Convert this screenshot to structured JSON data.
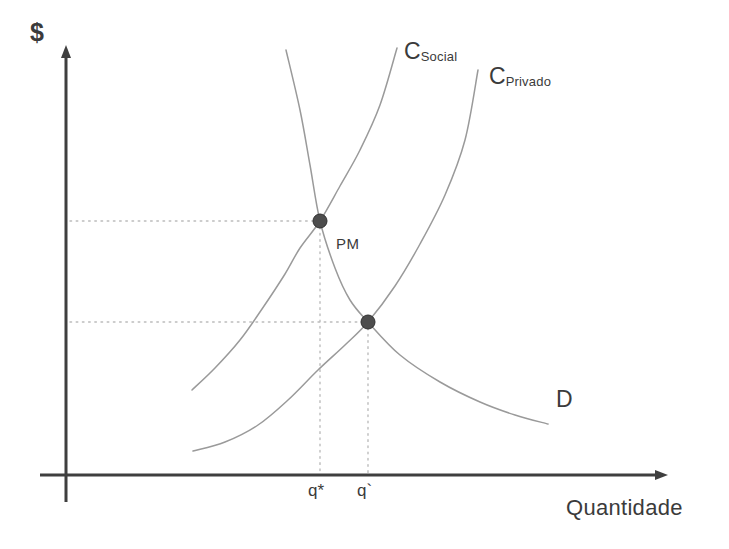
{
  "figure": {
    "background_color": "#ffffff",
    "axes": {
      "y_label": "$",
      "x_label": "Quantidade",
      "axis_color": "#3f3f3f",
      "y_axis_x": 66,
      "x_axis_y": 475,
      "y_axis_top": 45,
      "y_axis_bottom": 502,
      "x_axis_left": 40,
      "x_axis_right": 668
    },
    "curves": [
      {
        "name": "C_Social",
        "label_main": "C",
        "label_sub": "Social",
        "color": "#9a9a9a",
        "label_x": 404,
        "label_y": 40
      },
      {
        "name": "C_Privado",
        "label_main": "C",
        "label_sub": "Privado",
        "color": "#9a9a9a",
        "label_x": 489,
        "label_y": 65
      },
      {
        "name": "Demanda",
        "label_main": "D",
        "label_sub": "",
        "color": "#9a9a9a",
        "label_x": 556,
        "label_y": 388
      }
    ],
    "points": [
      {
        "name": "PM",
        "label": "PM",
        "x": 320,
        "y": 221,
        "color": "#4d4d4d",
        "radius": 7
      },
      {
        "name": "equilibrio-privado",
        "label": "",
        "x": 368,
        "y": 322,
        "color": "#4d4d4d",
        "radius": 7
      }
    ],
    "x_ticks": [
      {
        "label": "q*",
        "x": 320
      },
      {
        "label": "q`",
        "x": 368
      }
    ],
    "guide_lines": {
      "color": "#b9b9b9",
      "horizontal": [
        {
          "y": 221,
          "from_x": 70,
          "to_x": 320
        },
        {
          "y": 322,
          "from_x": 70,
          "to_x": 368
        }
      ],
      "vertical": [
        {
          "x": 320,
          "from_y": 221,
          "to_y": 475
        },
        {
          "x": 368,
          "from_y": 322,
          "to_y": 475
        }
      ]
    }
  },
  "chart_data": {
    "type": "line",
    "title": "",
    "xlabel": "Quantidade",
    "ylabel": "$",
    "xlim": [
      0,
      100
    ],
    "ylim": [
      0,
      100
    ],
    "grid": false,
    "legend": "inline-labels",
    "annotations": [
      "PM",
      "q*",
      "q`",
      "C",
      "Social",
      "Privado",
      "D"
    ],
    "series": [
      {
        "name": "C_Social",
        "label": "C Social",
        "description": "Curva de custo marginal social, crescente e a esquerda",
        "color": "#9a9a9a",
        "points_px": [
          [
            192,
            390
          ],
          [
            215,
            368
          ],
          [
            240,
            340
          ],
          [
            262,
            309
          ],
          [
            285,
            274
          ],
          [
            300,
            248
          ],
          [
            320,
            221
          ],
          [
            340,
            186
          ],
          [
            360,
            150
          ],
          [
            380,
            105
          ],
          [
            397,
            48
          ]
        ]
      },
      {
        "name": "C_Privado",
        "label": "C Privado",
        "description": "Curva de custo marginal privado, crescente e a direita",
        "color": "#9a9a9a",
        "points_px": [
          [
            193,
            451
          ],
          [
            225,
            442
          ],
          [
            258,
            425
          ],
          [
            288,
            400
          ],
          [
            318,
            370
          ],
          [
            345,
            345
          ],
          [
            368,
            322
          ],
          [
            395,
            286
          ],
          [
            420,
            244
          ],
          [
            445,
            195
          ],
          [
            465,
            140
          ],
          [
            478,
            70
          ]
        ]
      },
      {
        "name": "Demanda",
        "label": "D",
        "description": "Curva de demanda decrescente convexa",
        "color": "#9a9a9a",
        "points_px": [
          [
            286,
            50
          ],
          [
            300,
            110
          ],
          [
            310,
            165
          ],
          [
            320,
            221
          ],
          [
            335,
            268
          ],
          [
            350,
            300
          ],
          [
            368,
            322
          ],
          [
            400,
            355
          ],
          [
            440,
            382
          ],
          [
            480,
            402
          ],
          [
            515,
            415
          ],
          [
            548,
            424
          ]
        ]
      }
    ],
    "intersections": [
      {
        "name": "PM",
        "x_label": "q*",
        "x_px": 320,
        "y_px": 221
      },
      {
        "name": "equilibrio de mercado",
        "x_label": "q`",
        "x_px": 368,
        "y_px": 322
      }
    ]
  }
}
